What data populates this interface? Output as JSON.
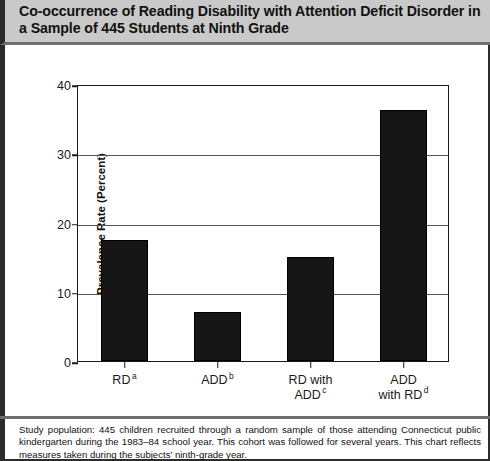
{
  "header": {
    "title": "Co-occurrence of Reading Disability with Attention Deficit Disorder in a Sample of 445 Students at Ninth Grade"
  },
  "footnote": {
    "text": "Study population: 445 children recruited through a random sample of those attending Connecticut public kindergarten during the 1983–84 school year. This cohort was followed for several years. This chart reflects measures taken during the subjects’ ninth-grade year."
  },
  "chart_data": {
    "type": "bar",
    "title": "Co-occurrence of Reading Disability with Attention Deficit Disorder in a Sample of 445 Students at Ninth Grade",
    "xlabel": "",
    "ylabel": "Prevalence Rate (Percent)",
    "categories": [
      "RD a",
      "ADD b",
      "RD with ADD c",
      "ADD with RD d"
    ],
    "category_lines": [
      [
        "RD"
      ],
      [
        "ADD"
      ],
      [
        "RD with",
        "ADD"
      ],
      [
        "ADD",
        "with RD"
      ]
    ],
    "category_footnote_marks": [
      "a",
      "b",
      "c",
      "d"
    ],
    "values": [
      17.5,
      7.1,
      15.0,
      36.3
    ],
    "ylim": [
      0,
      40
    ],
    "yticks": [
      0,
      10,
      20,
      30,
      40
    ],
    "ytick_labels": [
      "0",
      "10",
      "20",
      "30",
      "40"
    ],
    "grid": true,
    "grid_axis": "y",
    "legend": "none",
    "bar_color": "#161616"
  }
}
